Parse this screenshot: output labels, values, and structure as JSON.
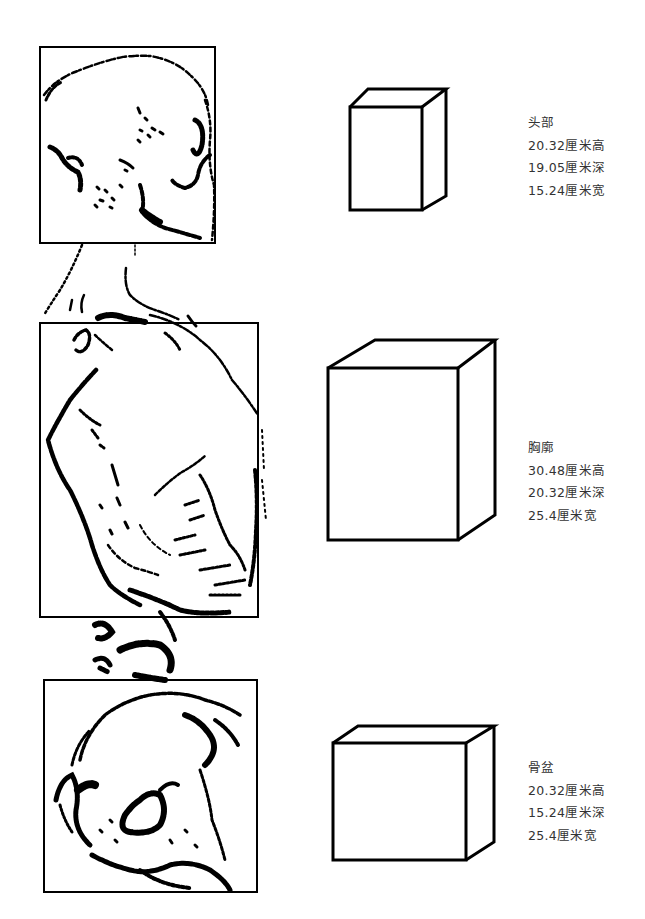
{
  "diagram": {
    "type": "anatomical-block-proportions",
    "sections": [
      {
        "id": "head",
        "name": "头部",
        "height": "20.32厘米高",
        "depth": "19.05厘米深",
        "width": "15.24厘米宽"
      },
      {
        "id": "chest",
        "name": "胸廓",
        "height": "30.48厘米高",
        "depth": "20.32厘米深",
        "width": "25.4厘米宽"
      },
      {
        "id": "pelvis",
        "name": "骨盆",
        "height": "20.32厘米高",
        "depth": "15.24厘米深",
        "width": "25.4厘米宽"
      }
    ]
  },
  "colors": {
    "background": "#ffffff",
    "ink": "#000000",
    "text": "#333333"
  }
}
